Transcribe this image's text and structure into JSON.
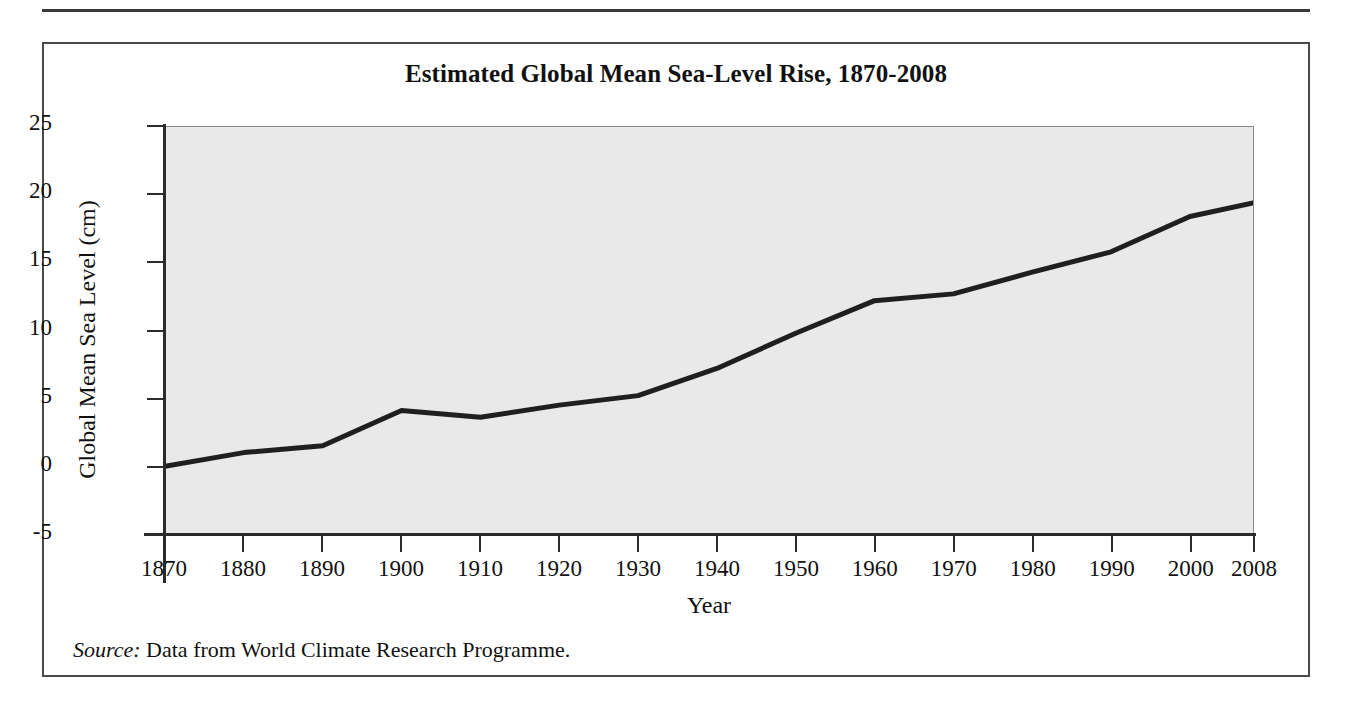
{
  "figure": {
    "title": "Estimated Global Mean Sea-Level Rise, 1870-2008",
    "source_label": "Source:",
    "source_text": " Data from World Climate Research Programme."
  },
  "chart_data": {
    "type": "line",
    "title": "Estimated Global Mean Sea-Level Rise, 1870-2008",
    "xlabel": "Year",
    "ylabel": "Global Mean Sea Level (cm)",
    "x": [
      1870,
      1880,
      1890,
      1900,
      1910,
      1920,
      1930,
      1940,
      1950,
      1960,
      1970,
      1980,
      1990,
      2000,
      2008
    ],
    "values": [
      0.0,
      1.0,
      1.5,
      4.1,
      3.6,
      4.5,
      5.2,
      7.2,
      9.8,
      12.2,
      12.7,
      14.3,
      15.8,
      18.4,
      19.4
    ],
    "series": [
      {
        "name": "Global Mean Sea Level",
        "values": [
          0.0,
          1.0,
          1.5,
          4.1,
          3.6,
          4.5,
          5.2,
          7.2,
          9.8,
          12.2,
          12.7,
          14.3,
          15.8,
          18.4,
          19.4
        ]
      }
    ],
    "xticks": [
      "1870",
      "1880",
      "1890",
      "1900",
      "1910",
      "1920",
      "1930",
      "1940",
      "1950",
      "1960",
      "1970",
      "1980",
      "1990",
      "2000",
      "2008"
    ],
    "xtick_values": [
      1870,
      1880,
      1890,
      1900,
      1910,
      1920,
      1930,
      1940,
      1950,
      1960,
      1970,
      1980,
      1990,
      2000,
      2008
    ],
    "yticks": [
      "25",
      "20",
      "15",
      "10",
      "5",
      "0",
      "-5"
    ],
    "ytick_values": [
      25,
      20,
      15,
      10,
      5,
      0,
      -5
    ],
    "xlim": [
      1870,
      2008
    ],
    "ylim": [
      -5,
      25
    ],
    "grid": false,
    "legend": false,
    "line_color": "#1f1f1f",
    "plot_background": "#e9e9e9",
    "figure_background": "#ffffff"
  }
}
